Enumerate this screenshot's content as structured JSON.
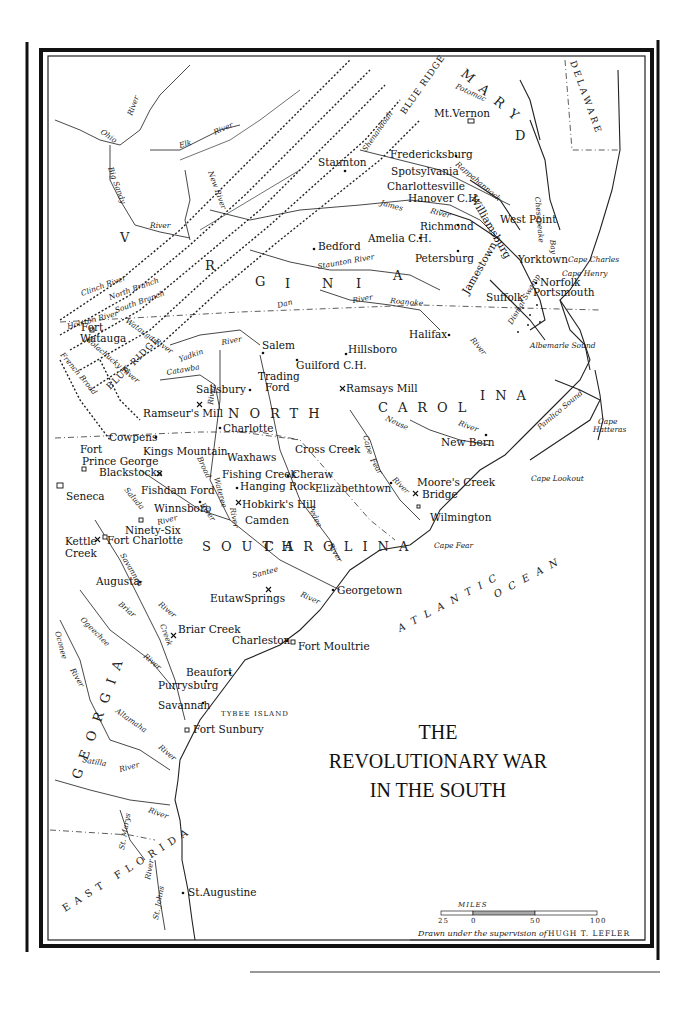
{
  "map": {
    "title_lines": [
      "THE",
      "REVOLUTIONARY WAR",
      "IN THE SOUTH"
    ],
    "credit": {
      "prefix": "Drawn under the supervision of",
      "name": "HUGH T. LEFLER"
    },
    "scale_bar": {
      "label": "MILES",
      "ticks": [
        "25",
        "0",
        "50",
        "100"
      ]
    },
    "regions": [
      {
        "id": "virginia",
        "label": "V  I  R  G  I  N  I  A"
      },
      {
        "id": "maryland",
        "label": "M A R Y L A N D"
      },
      {
        "id": "delaware",
        "label": "DELAWARE"
      },
      {
        "id": "north-carolina-1",
        "label": "N O R T H"
      },
      {
        "id": "north-carolina-2",
        "label": "C A R O L I N A"
      },
      {
        "id": "south-carolina",
        "label": "S O U T H   C A R O L I N A"
      },
      {
        "id": "georgia",
        "label": "G E O R G I A"
      },
      {
        "id": "east-florida",
        "label": "EAST FLORIDA"
      },
      {
        "id": "blue-ridge-1",
        "label": "BLUE RIDGE"
      },
      {
        "id": "blue-ridge-2",
        "label": "BLUE RIDGE"
      }
    ],
    "ocean": {
      "line1": "ATLANTIC",
      "line2": "OCEAN"
    },
    "places": [
      {
        "name": "Mt. Vernon",
        "type": "estate"
      },
      {
        "name": "Staunton",
        "type": "town"
      },
      {
        "name": "Fredericksburg",
        "type": "town"
      },
      {
        "name": "Spotsylvania",
        "type": "town"
      },
      {
        "name": "Charlottesville",
        "type": "town"
      },
      {
        "name": "Hanover C.H.",
        "type": "town"
      },
      {
        "name": "Williamsburg",
        "type": "town"
      },
      {
        "name": "West Point",
        "type": "town"
      },
      {
        "name": "Richmond",
        "type": "town"
      },
      {
        "name": "Amelia C.H.",
        "type": "town"
      },
      {
        "name": "Bedford",
        "type": "town"
      },
      {
        "name": "Petersburg",
        "type": "town"
      },
      {
        "name": "Jamestown",
        "type": "town"
      },
      {
        "name": "Yorktown",
        "type": "battle"
      },
      {
        "name": "Norfolk",
        "type": "town"
      },
      {
        "name": "Portsmouth",
        "type": "town"
      },
      {
        "name": "Suffolk",
        "type": "town"
      },
      {
        "name": "Halifax",
        "type": "town"
      },
      {
        "name": "Salem",
        "type": "town"
      },
      {
        "name": "Hillsboro",
        "type": "town"
      },
      {
        "name": "Guilford C.H.",
        "type": "battle"
      },
      {
        "name": "Fort Watauga",
        "type": "fort"
      },
      {
        "name": "Trading Ford",
        "type": "ford"
      },
      {
        "name": "Salisbury",
        "type": "town"
      },
      {
        "name": "Ramsays Mill",
        "type": "battle"
      },
      {
        "name": "Ramseur's Mill",
        "type": "battle"
      },
      {
        "name": "Charlotte",
        "type": "town"
      },
      {
        "name": "Cowpens",
        "type": "battle"
      },
      {
        "name": "Kings Mountain",
        "type": "battle"
      },
      {
        "name": "Cross Creek",
        "type": "town"
      },
      {
        "name": "New Bern",
        "type": "town"
      },
      {
        "name": "Fort Prince George",
        "type": "fort"
      },
      {
        "name": "Blackstocks",
        "type": "battle"
      },
      {
        "name": "Waxhaws",
        "type": "battle"
      },
      {
        "name": "Fishing Creek",
        "type": "battle"
      },
      {
        "name": "Cheraw",
        "type": "town"
      },
      {
        "name": "Hanging Rock",
        "type": "battle"
      },
      {
        "name": "Elizabethtown",
        "type": "town"
      },
      {
        "name": "Moore's Creek Bridge",
        "type": "battle"
      },
      {
        "name": "Fishdam Ford",
        "type": "battle"
      },
      {
        "name": "Hobkirk's Hill",
        "type": "battle"
      },
      {
        "name": "Seneca",
        "type": "village"
      },
      {
        "name": "Winnsboro",
        "type": "town"
      },
      {
        "name": "Camden",
        "type": "battle"
      },
      {
        "name": "Wilmington",
        "type": "town"
      },
      {
        "name": "Ninety-Six",
        "type": "fort"
      },
      {
        "name": "Kettle Creek",
        "type": "battle"
      },
      {
        "name": "Fort Charlotte",
        "type": "fort"
      },
      {
        "name": "Augusta",
        "type": "town"
      },
      {
        "name": "Eutaw Springs",
        "type": "battle"
      },
      {
        "name": "Georgetown",
        "type": "town"
      },
      {
        "name": "Briar Creek",
        "type": "battle"
      },
      {
        "name": "Charleston",
        "type": "town"
      },
      {
        "name": "Fort Moultrie",
        "type": "fort"
      },
      {
        "name": "Beaufort",
        "type": "town"
      },
      {
        "name": "Purrysburg",
        "type": "town"
      },
      {
        "name": "Savannah",
        "type": "town"
      },
      {
        "name": "TYBEE ISLAND",
        "type": "island"
      },
      {
        "name": "Fort Sunbury",
        "type": "fort"
      },
      {
        "name": "St. Augustine",
        "type": "town"
      }
    ],
    "capes": [
      "Cape Charles",
      "Cape Henry",
      "Cape Hatteras",
      "Cape Lookout",
      "Cape Fear"
    ],
    "water_features": [
      "Albemarle Sound",
      "Pamlico Sound",
      "Chesapeake Bay",
      "Dismal Swamp"
    ],
    "rivers": [
      "Ohio River",
      "Big Sandy River",
      "Elk River",
      "New River",
      "Potomac",
      "Shenandoah",
      "Rappahannock River",
      "James River",
      "York R.",
      "Staunton River",
      "Dan River",
      "Roanoke River",
      "Clinch River",
      "North Branch",
      "South Branch",
      "Holston River",
      "Watauga River",
      "Nolachucky River",
      "French Broad",
      "Yadkin River",
      "Catawba",
      "Neuse River",
      "Cape Fear River",
      "Broad River",
      "Wateree River",
      "Pedee River",
      "Saluda",
      "Santee River",
      "Savannah River",
      "Briar Creek",
      "Ogeechee River",
      "Oconee River",
      "Altamaha River",
      "Satilla River",
      "St. Marys River",
      "St. Johns River"
    ]
  }
}
